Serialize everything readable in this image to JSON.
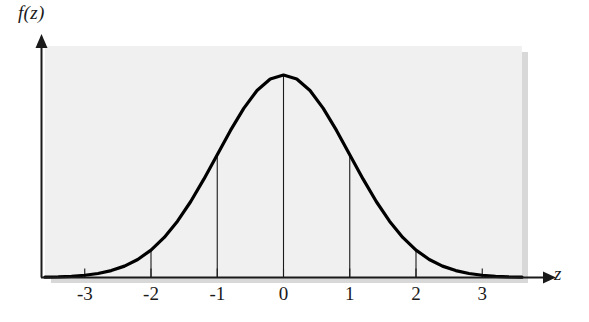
{
  "figure": {
    "name": "standard-normal-distribution-curve",
    "background_color": "#ffffff",
    "plot_area_color": "#f0f0f0",
    "curve_color": "#000000",
    "axis_color": "#1a1a1a"
  },
  "axes": {
    "y_axis_label": "f(z)",
    "x_axis_label": "z"
  },
  "chart_data": {
    "type": "line",
    "title": "",
    "subtitle": "",
    "xlabel": "z",
    "ylabel": "f(z)",
    "xlim": [
      -3.6,
      3.6
    ],
    "ylim": [
      0,
      0.44
    ],
    "grid": false,
    "legend": null,
    "tick_labels": [
      "-3",
      "-2",
      "-1",
      "0",
      "1",
      "2",
      "3"
    ],
    "tick_values": [
      -3,
      -2,
      -1,
      0,
      1,
      2,
      3
    ],
    "y_tick_labels": [],
    "annotations": [],
    "series": [
      {
        "name": "standard normal density",
        "x": [
          -3.6,
          -3.4,
          -3.2,
          -3.0,
          -2.8,
          -2.6,
          -2.4,
          -2.2,
          -2.0,
          -1.8,
          -1.6,
          -1.4,
          -1.2,
          -1.0,
          -0.8,
          -0.6,
          -0.4,
          -0.2,
          0.0,
          0.2,
          0.4,
          0.6,
          0.8,
          1.0,
          1.2,
          1.4,
          1.6,
          1.8,
          2.0,
          2.2,
          2.4,
          2.6,
          2.8,
          3.0,
          3.2,
          3.4,
          3.6
        ],
        "y": [
          0.0006,
          0.0012,
          0.0024,
          0.0044,
          0.0079,
          0.0136,
          0.0224,
          0.0355,
          0.054,
          0.079,
          0.1109,
          0.1497,
          0.1942,
          0.242,
          0.2897,
          0.3332,
          0.3683,
          0.391,
          0.3989,
          0.391,
          0.3683,
          0.3332,
          0.2897,
          0.242,
          0.1942,
          0.1497,
          0.1109,
          0.079,
          0.054,
          0.0355,
          0.0224,
          0.0136,
          0.0079,
          0.0044,
          0.0024,
          0.0012,
          0.0006
        ]
      }
    ],
    "vertical_reference_lines": [
      -3,
      -2,
      -1,
      0,
      1,
      2,
      3
    ]
  }
}
